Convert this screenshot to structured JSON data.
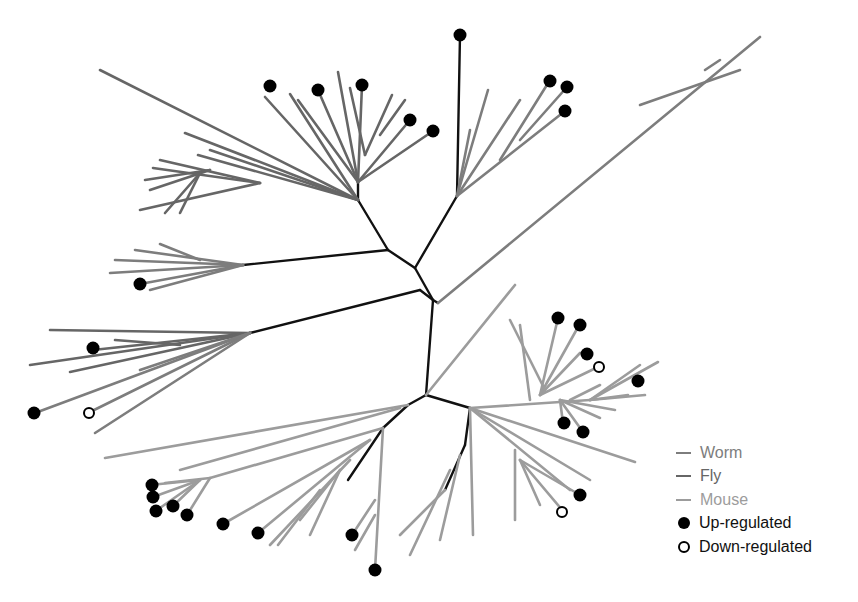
{
  "colors": {
    "worm": "#7d7d7d",
    "fly": "#666666",
    "mouse": "#9c9c9c",
    "core": "#111111",
    "up": "#000000",
    "down": "#000000"
  },
  "legend": {
    "items": [
      {
        "label": "Worm",
        "type": "line",
        "color": "#7d7d7d"
      },
      {
        "label": "Fly",
        "type": "line",
        "color": "#666666"
      },
      {
        "label": "Mouse",
        "type": "line",
        "color": "#9c9c9c"
      },
      {
        "label": "Up-regulated",
        "type": "filled-dot"
      },
      {
        "label": "Down-regulated",
        "type": "open-dot"
      }
    ]
  },
  "tree": {
    "core": [
      [
        433,
        300,
        415,
        268
      ],
      [
        415,
        268,
        388,
        250
      ],
      [
        388,
        250,
        358,
        200
      ],
      [
        358,
        200,
        358,
        180
      ],
      [
        415,
        268,
        457,
        196
      ],
      [
        457,
        196,
        460,
        35
      ],
      [
        433,
        300,
        426,
        395
      ],
      [
        433,
        300,
        420,
        290
      ],
      [
        420,
        290,
        250,
        333
      ],
      [
        388,
        250,
        243,
        265
      ],
      [
        426,
        395,
        408,
        405
      ],
      [
        408,
        405,
        383,
        428
      ],
      [
        383,
        428,
        348,
        480
      ],
      [
        426,
        395,
        470,
        408
      ],
      [
        470,
        408,
        465,
        445
      ],
      [
        465,
        445,
        445,
        490
      ],
      [
        433,
        300,
        438,
        303
      ]
    ],
    "fly": [
      [
        358,
        200,
        100,
        70
      ],
      [
        358,
        200,
        185,
        133
      ],
      [
        358,
        200,
        210,
        150
      ],
      [
        358,
        200,
        198,
        155
      ],
      [
        260,
        183,
        160,
        160
      ],
      [
        260,
        183,
        153,
        168
      ],
      [
        260,
        183,
        140,
        210
      ],
      [
        200,
        173,
        180,
        213
      ],
      [
        200,
        173,
        165,
        213
      ],
      [
        210,
        170,
        145,
        180
      ],
      [
        210,
        170,
        150,
        190
      ],
      [
        358,
        200,
        265,
        97
      ],
      [
        358,
        200,
        290,
        94
      ],
      [
        358,
        182,
        298,
        100
      ],
      [
        358,
        182,
        318,
        90
      ],
      [
        358,
        182,
        338,
        72
      ],
      [
        358,
        182,
        362,
        85
      ],
      [
        358,
        182,
        410,
        120
      ],
      [
        358,
        182,
        433,
        131
      ],
      [
        365,
        155,
        350,
        88
      ],
      [
        365,
        155,
        392,
        95
      ],
      [
        380,
        135,
        405,
        100
      ],
      [
        250,
        333,
        50,
        330
      ],
      [
        250,
        333,
        93,
        350
      ],
      [
        250,
        333,
        30,
        365
      ],
      [
        250,
        333,
        70,
        372
      ],
      [
        180,
        345,
        115,
        340
      ]
    ],
    "worm": [
      [
        243,
        265,
        135,
        250
      ],
      [
        243,
        265,
        115,
        260
      ],
      [
        243,
        265,
        110,
        273
      ],
      [
        243,
        265,
        140,
        284
      ],
      [
        243,
        265,
        150,
        290
      ],
      [
        200,
        260,
        160,
        244
      ],
      [
        250,
        333,
        35,
        413
      ],
      [
        250,
        333,
        88,
        413
      ],
      [
        250,
        333,
        95,
        433
      ],
      [
        250,
        333,
        140,
        370
      ],
      [
        457,
        196,
        488,
        90
      ],
      [
        457,
        196,
        470,
        130
      ],
      [
        457,
        196,
        520,
        100
      ],
      [
        457,
        196,
        565,
        111
      ],
      [
        500,
        160,
        550,
        80
      ],
      [
        520,
        140,
        567,
        87
      ],
      [
        438,
        303,
        760,
        37
      ],
      [
        640,
        105,
        740,
        70
      ],
      [
        720,
        60,
        705,
        70
      ]
    ],
    "mouse": [
      [
        426,
        395,
        515,
        285
      ],
      [
        408,
        405,
        105,
        458
      ],
      [
        400,
        408,
        180,
        470
      ],
      [
        383,
        428,
        210,
        478
      ],
      [
        210,
        478,
        165,
        483
      ],
      [
        200,
        480,
        150,
        485
      ],
      [
        200,
        480,
        153,
        497
      ],
      [
        200,
        480,
        157,
        510
      ],
      [
        200,
        480,
        173,
        506
      ],
      [
        210,
        478,
        187,
        515
      ],
      [
        370,
        440,
        223,
        524
      ],
      [
        370,
        440,
        258,
        533
      ],
      [
        350,
        460,
        270,
        545
      ],
      [
        340,
        470,
        300,
        520
      ],
      [
        340,
        470,
        310,
        535
      ],
      [
        320,
        490,
        278,
        545
      ],
      [
        383,
        428,
        375,
        570
      ],
      [
        375,
        500,
        352,
        535
      ],
      [
        375,
        515,
        355,
        550
      ],
      [
        445,
        490,
        400,
        535
      ],
      [
        450,
        470,
        410,
        555
      ],
      [
        460,
        455,
        440,
        540
      ],
      [
        470,
        408,
        473,
        535
      ],
      [
        470,
        408,
        590,
        400
      ],
      [
        590,
        400,
        640,
        365
      ],
      [
        590,
        400,
        658,
        362
      ],
      [
        590,
        400,
        645,
        395
      ],
      [
        590,
        400,
        628,
        395
      ],
      [
        570,
        400,
        600,
        385
      ],
      [
        540,
        395,
        582,
        320
      ],
      [
        540,
        395,
        558,
        318
      ],
      [
        540,
        395,
        580,
        353
      ],
      [
        540,
        395,
        598,
        367
      ],
      [
        530,
        400,
        520,
        325
      ],
      [
        545,
        390,
        510,
        320
      ],
      [
        560,
        400,
        563,
        423
      ],
      [
        560,
        400,
        583,
        432
      ],
      [
        560,
        400,
        615,
        410
      ],
      [
        560,
        400,
        600,
        418
      ],
      [
        470,
        408,
        635,
        462
      ],
      [
        470,
        408,
        590,
        480
      ],
      [
        470,
        408,
        570,
        490
      ],
      [
        520,
        460,
        580,
        495
      ],
      [
        520,
        460,
        563,
        511
      ],
      [
        520,
        460,
        540,
        505
      ],
      [
        515,
        450,
        515,
        520
      ]
    ]
  },
  "nodes": {
    "up": [
      [
        460,
        35
      ],
      [
        270,
        86
      ],
      [
        318,
        90
      ],
      [
        362,
        85
      ],
      [
        410,
        120
      ],
      [
        433,
        131
      ],
      [
        550,
        81
      ],
      [
        567,
        87
      ],
      [
        565,
        111
      ],
      [
        140,
        284
      ],
      [
        93,
        348
      ],
      [
        34,
        413
      ],
      [
        558,
        318
      ],
      [
        580,
        325
      ],
      [
        587,
        354
      ],
      [
        638,
        381
      ],
      [
        564,
        423
      ],
      [
        583,
        432
      ],
      [
        580,
        495
      ],
      [
        152,
        485
      ],
      [
        153,
        497
      ],
      [
        156,
        511
      ],
      [
        173,
        506
      ],
      [
        187,
        515
      ],
      [
        223,
        524
      ],
      [
        258,
        533
      ],
      [
        352,
        535
      ],
      [
        375,
        570
      ]
    ],
    "down": [
      [
        89,
        413
      ],
      [
        599,
        367
      ],
      [
        562,
        512
      ]
    ]
  }
}
